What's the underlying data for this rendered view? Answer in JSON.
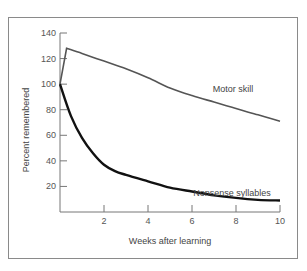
{
  "chart_data": {
    "type": "line",
    "title": "",
    "xlabel": "Weeks after learning",
    "ylabel": "Percent remembered",
    "xlim": [
      0,
      10
    ],
    "ylim": [
      0,
      140
    ],
    "x_ticks": [
      2,
      4,
      6,
      8,
      10
    ],
    "y_ticks": [
      20,
      40,
      60,
      80,
      100,
      120,
      140
    ],
    "grid": false,
    "legend": "inline labels",
    "series": [
      {
        "name": "Motor skill",
        "color": "#555555",
        "points": [
          [
            0,
            100
          ],
          [
            0.3,
            128
          ],
          [
            1,
            124
          ],
          [
            2,
            118
          ],
          [
            3,
            112
          ],
          [
            4,
            105
          ],
          [
            5,
            97
          ],
          [
            6,
            91
          ],
          [
            7,
            86
          ],
          [
            8,
            81
          ],
          [
            9,
            76
          ],
          [
            10,
            71
          ]
        ]
      },
      {
        "name": "Nonsense syllables",
        "color": "#111111",
        "points": [
          [
            0,
            100
          ],
          [
            0.5,
            75
          ],
          [
            1,
            58
          ],
          [
            1.5,
            46
          ],
          [
            2,
            37
          ],
          [
            2.5,
            32
          ],
          [
            3,
            29
          ],
          [
            4,
            24
          ],
          [
            5,
            19
          ],
          [
            6,
            16
          ],
          [
            7,
            13
          ],
          [
            8,
            11
          ],
          [
            9,
            9.5
          ],
          [
            10,
            9
          ]
        ]
      }
    ]
  }
}
